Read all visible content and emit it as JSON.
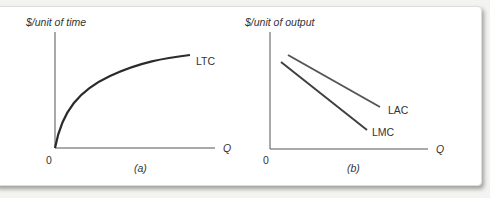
{
  "figure": {
    "panels": [
      {
        "id": "a",
        "caption": "(a)",
        "y_axis_label": "$/unit of time",
        "x_axis_label": "Q",
        "origin_label": "0",
        "curves": [
          {
            "name": "LTC",
            "shape": "concave increasing from origin"
          }
        ]
      },
      {
        "id": "b",
        "caption": "(b)",
        "y_axis_label": "$/unit of output",
        "x_axis_label": "Q",
        "origin_label": "0",
        "curves": [
          {
            "name": "LAC",
            "shape": "downward sloping line"
          },
          {
            "name": "LMC",
            "shape": "downward sloping line, below LAC"
          }
        ]
      }
    ],
    "colors": {
      "axis": "#555555",
      "ltc": "#2b2b2b",
      "lac": "#555555",
      "lmc": "#404040",
      "background": "#ffffff"
    }
  }
}
